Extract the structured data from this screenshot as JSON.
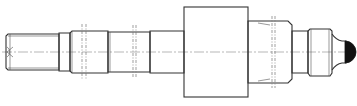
{
  "drawing": {
    "type": "technical-shaft-drawing",
    "colors": {
      "line": "#333333",
      "background": "#ffffff",
      "tip_fill": "#111111"
    },
    "centerline_y": 52,
    "segments": [
      {
        "name": "threaded-end-left",
        "x1": 6,
        "x2": 59,
        "half_height": 18
      },
      {
        "name": "collar-1",
        "x1": 59,
        "x2": 70,
        "half_height": 19
      },
      {
        "name": "journal-1",
        "x1": 70,
        "x2": 108,
        "half_height": 21
      },
      {
        "name": "journal-2",
        "x1": 108,
        "x2": 150,
        "half_height": 20
      },
      {
        "name": "journal-3",
        "x1": 150,
        "x2": 184,
        "half_height": 21
      },
      {
        "name": "main-block",
        "x1": 184,
        "x2": 248,
        "half_height": 45
      },
      {
        "name": "journal-4",
        "x1": 248,
        "x2": 292,
        "half_height": 31
      },
      {
        "name": "neck",
        "x1": 292,
        "x2": 308,
        "half_height": 21
      },
      {
        "name": "threaded-end-right",
        "x1": 308,
        "x2": 332,
        "half_height": 23
      },
      {
        "name": "ball-tip",
        "x1": 332,
        "x2": 356,
        "half_height": 12
      }
    ],
    "section_marks_x": [
      82,
      86,
      133,
      136,
      272,
      275
    ]
  }
}
